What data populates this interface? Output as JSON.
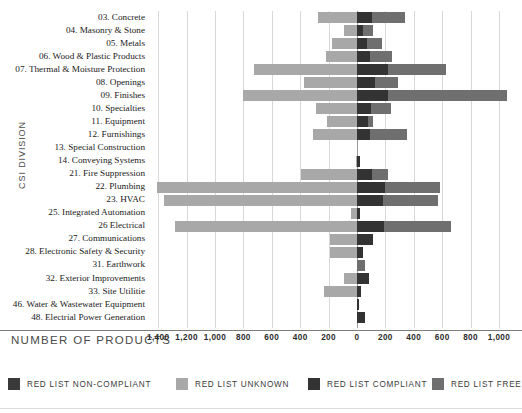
{
  "axes": {
    "y_title": "CSI DIVISION",
    "x_title": "NUMBER OF PRODUCTS",
    "x_ticks": [
      "1,400",
      "1,200",
      "1,000",
      "800",
      "600",
      "400",
      "200",
      "0",
      "200",
      "400",
      "600",
      "800",
      "1,000"
    ]
  },
  "legend": {
    "items": [
      {
        "label": "RED LIST NON-COMPLIANT",
        "color": "#3a3a3a",
        "name": "legend-non-compliant"
      },
      {
        "label": "RED LIST UNKNOWN",
        "color": "#a8a8a8",
        "name": "legend-unknown"
      },
      {
        "label": "RED LIST COMPLIANT",
        "color": "#333333",
        "name": "legend-compliant"
      },
      {
        "label": "RED LIST FREE",
        "color": "#6f6f6f",
        "name": "legend-free"
      }
    ]
  },
  "chart_data": {
    "type": "bar",
    "orientation": "horizontal",
    "stacked": "diverging",
    "title": "",
    "xlabel": "NUMBER OF PRODUCTS",
    "ylabel": "CSI DIVISION",
    "xlim": [
      -1500,
      1100
    ],
    "xticks": [
      -1400,
      -1200,
      -1000,
      -800,
      -600,
      -400,
      -200,
      0,
      200,
      400,
      600,
      800,
      1000
    ],
    "grid": true,
    "legend_position": "bottom",
    "series": [
      {
        "name": "RED LIST NON-COMPLIANT",
        "color": "#3a3a3a",
        "side": "left"
      },
      {
        "name": "RED LIST UNKNOWN",
        "color": "#a8a8a8",
        "side": "left"
      },
      {
        "name": "RED LIST COMPLIANT",
        "color": "#333333",
        "side": "right"
      },
      {
        "name": "RED LIST FREE",
        "color": "#6f6f6f",
        "side": "right"
      }
    ],
    "categories": [
      "03. Concrete",
      "04. Masonry & Stone",
      "05. Metals",
      "06. Wood & Plastic Products",
      "07. Thermal & Moisture Protection",
      "08. Openings",
      "09. Finishes",
      "10. Specialties",
      "11. Equipment",
      "12. Furnishings",
      "13. Special Construction",
      "14. Conveying Systems",
      "21. Fire Suppression",
      "22. Plumbing",
      "23. HVAC",
      "25. Integrated Automation",
      "26 Electrical",
      "27. Communications",
      "28. Electronic Safety & Security",
      "31. Earthwork",
      "32. Exterior Improvements",
      "33. Site Utilitie",
      "46. Water & Wastewater Equipment",
      "48. Electrial Power Generation"
    ],
    "rows": [
      {
        "category": "03. Concrete",
        "non_compliant": 0,
        "unknown": 275,
        "compliant": 105,
        "free": 230
      },
      {
        "category": "04. Masonry & Stone",
        "non_compliant": 0,
        "unknown": 90,
        "compliant": 45,
        "free": 70
      },
      {
        "category": "05. Metals",
        "non_compliant": 0,
        "unknown": 175,
        "compliant": 70,
        "free": 105
      },
      {
        "category": "06. Wood & Plastic Products",
        "non_compliant": 0,
        "unknown": 215,
        "compliant": 95,
        "free": 155
      },
      {
        "category": "07. Thermal & Moisture Protection",
        "non_compliant": 0,
        "unknown": 725,
        "compliant": 215,
        "free": 410
      },
      {
        "category": "08. Openings",
        "non_compliant": 0,
        "unknown": 375,
        "compliant": 125,
        "free": 165
      },
      {
        "category": "09. Finishes",
        "non_compliant": 0,
        "unknown": 800,
        "compliant": 215,
        "free": 840
      },
      {
        "category": "10. Specialties",
        "non_compliant": 0,
        "unknown": 290,
        "compliant": 100,
        "free": 140
      },
      {
        "category": "11. Equipment",
        "non_compliant": 0,
        "unknown": 210,
        "compliant": 75,
        "free": 40
      },
      {
        "category": "12. Furnishings",
        "non_compliant": 0,
        "unknown": 310,
        "compliant": 95,
        "free": 255
      },
      {
        "category": "13. Special Construction",
        "non_compliant": 0,
        "unknown": 0,
        "compliant": 0,
        "free": 0
      },
      {
        "category": "14. Conveying Systems",
        "non_compliant": 0,
        "unknown": 10,
        "compliant": 20,
        "free": 0
      },
      {
        "category": "21. Fire Suppression",
        "non_compliant": 0,
        "unknown": 395,
        "compliant": 105,
        "free": 115
      },
      {
        "category": "22. Plumbing",
        "non_compliant": 0,
        "unknown": 1410,
        "compliant": 195,
        "free": 390
      },
      {
        "category": "23. HVAC",
        "non_compliant": 0,
        "unknown": 1360,
        "compliant": 185,
        "free": 385
      },
      {
        "category": "25. Integrated Automation",
        "non_compliant": 0,
        "unknown": 45,
        "compliant": 20,
        "free": 0
      },
      {
        "category": "26 Electrical",
        "non_compliant": 0,
        "unknown": 1280,
        "compliant": 190,
        "free": 470
      },
      {
        "category": "27. Communications",
        "non_compliant": 0,
        "unknown": 190,
        "compliant": 110,
        "free": 0
      },
      {
        "category": "28. Electronic Safety & Security",
        "non_compliant": 0,
        "unknown": 190,
        "compliant": 45,
        "free": 0
      },
      {
        "category": "31. Earthwork",
        "non_compliant": 0,
        "unknown": 0,
        "compliant": 0,
        "free": 55
      },
      {
        "category": "32. Exterior Improvements",
        "non_compliant": 0,
        "unknown": 95,
        "compliant": 85,
        "free": 0
      },
      {
        "category": "33. Site Utilitie",
        "non_compliant": 0,
        "unknown": 230,
        "compliant": 30,
        "free": 0
      },
      {
        "category": "46. Water & Wastewater Equipment",
        "non_compliant": 0,
        "unknown": 0,
        "compliant": 15,
        "free": 0
      },
      {
        "category": "48. Electrial Power Generation",
        "non_compliant": 0,
        "unknown": 0,
        "compliant": 55,
        "free": 0
      }
    ]
  }
}
